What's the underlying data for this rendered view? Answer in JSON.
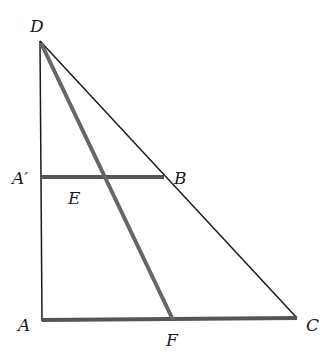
{
  "diagram": {
    "type": "geometry",
    "colors": {
      "thin_line": "#1a1a1a",
      "thick_line": "#555555",
      "label": "#1a1a1a"
    },
    "points": {
      "D": {
        "label": "D",
        "x": 39,
        "y": 41
      },
      "A_prime": {
        "label": "A′",
        "x": 42,
        "y": 177
      },
      "B": {
        "label": "B",
        "x": 164,
        "y": 177
      },
      "E": {
        "label": "E",
        "x": 87,
        "y": 177
      },
      "A": {
        "label": "A",
        "x": 42,
        "y": 321
      },
      "F": {
        "label": "F",
        "x": 173,
        "y": 320
      },
      "C": {
        "label": "C",
        "x": 297,
        "y": 318
      }
    },
    "segments": [
      {
        "from": "D",
        "to": "A",
        "style": "thin"
      },
      {
        "from": "D",
        "to": "C",
        "style": "thin"
      },
      {
        "from": "D",
        "to": "F",
        "style": "thick"
      },
      {
        "from": "A_prime",
        "to": "B",
        "style": "thick"
      },
      {
        "from": "A",
        "to": "C",
        "style": "thick"
      }
    ]
  }
}
